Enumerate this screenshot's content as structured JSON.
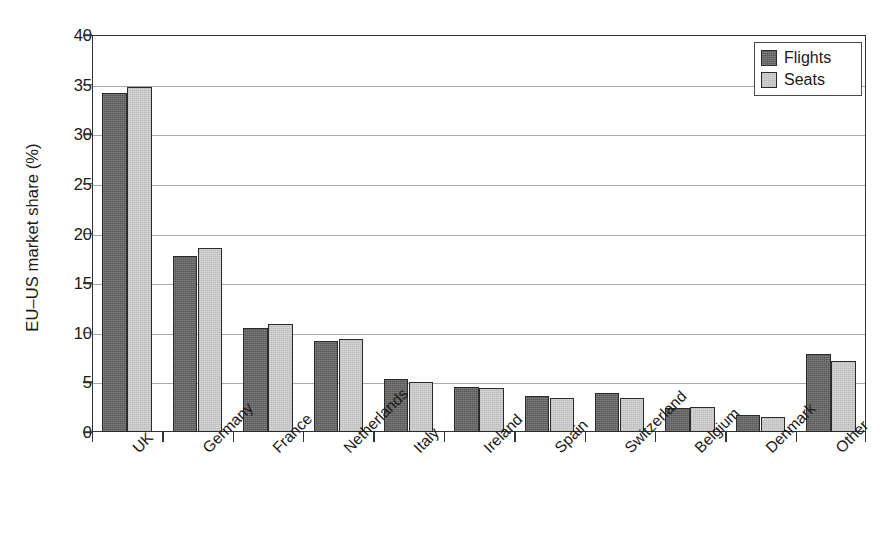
{
  "chart_data": {
    "type": "bar",
    "title": "",
    "subtitle": "",
    "xlabel": "",
    "ylabel": "EU–US market share (%)",
    "ylim": [
      0,
      40
    ],
    "yticks": [
      0,
      5,
      10,
      15,
      20,
      25,
      30,
      35,
      40
    ],
    "ytick_labels": [
      "0",
      "5",
      "10",
      "15",
      "20",
      "25",
      "30",
      "35",
      "40"
    ],
    "grid": "horizontal",
    "legend_position": "top-right",
    "categories": [
      "UK",
      "Germany",
      "France",
      "Netherlands",
      "Italy",
      "Ireland",
      "Spain",
      "Switzerland",
      "Belgium",
      "Denmark",
      "Other"
    ],
    "series": [
      {
        "name": "Flights",
        "color": "#575757",
        "values": [
          34.2,
          17.7,
          10.5,
          9.2,
          5.3,
          4.5,
          3.6,
          3.9,
          2.4,
          1.7,
          7.9
        ]
      },
      {
        "name": "Seats",
        "color": "#d6d6d6",
        "values": [
          34.8,
          18.5,
          10.9,
          9.4,
          5.0,
          4.4,
          3.4,
          3.4,
          2.5,
          1.5,
          7.2
        ]
      }
    ]
  },
  "legend": {
    "items": [
      {
        "label": "Flights",
        "swatch": "flights"
      },
      {
        "label": "Seats",
        "swatch": "seats"
      }
    ]
  },
  "colors": {
    "flights": "#575757",
    "seats": "#d6d6d6",
    "axis": "#333333",
    "gridline": "#a9a9a9",
    "text": "#1a1a1a",
    "background": "#ffffff"
  }
}
